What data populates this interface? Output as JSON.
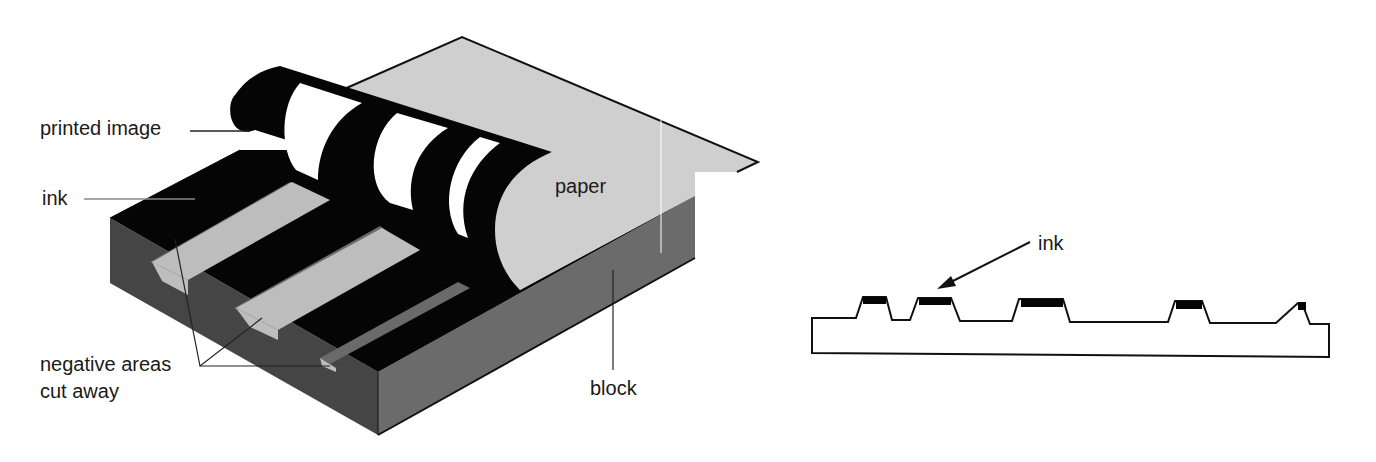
{
  "figure": {
    "left_diagram": {
      "labels": {
        "printed_image": "printed image",
        "ink": "ink",
        "paper": "paper",
        "negative_line1": "negative areas",
        "negative_line2": "cut away",
        "block": "block"
      }
    },
    "right_diagram": {
      "labels": {
        "ink": "ink"
      }
    },
    "colors": {
      "black": "#050505",
      "block_dark": "#4a4a4a",
      "block_side": "#6e6e6e",
      "groove_light": "#bdbdbd",
      "groove_wall": "#6a6a6a",
      "paper": "#cfcfcf",
      "white": "#ffffff"
    }
  }
}
